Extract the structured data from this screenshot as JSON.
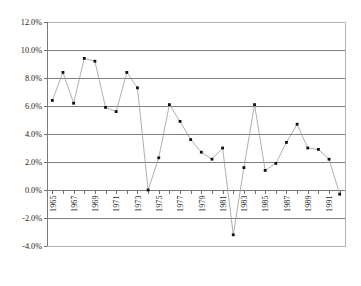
{
  "chart_data": {
    "type": "line",
    "title": "",
    "subtitle": "",
    "xlabel": "",
    "ylabel": "",
    "grid": true,
    "legend": null,
    "legend_position": "none",
    "marker": "square",
    "ylim": [
      -0.04,
      0.12
    ],
    "y_ticks": [
      0.12,
      0.1,
      0.08,
      0.06,
      0.04,
      0.02,
      0.0,
      -0.02,
      -0.04
    ],
    "y_tick_labels": [
      "12.0%",
      "10.0%",
      "8.0%",
      "6.0%",
      "4.0%",
      "2.0%",
      "0.0%",
      "-2.0%",
      "-4.0%"
    ],
    "x_tick_labels": [
      "1965",
      "1967",
      "1969",
      "1971",
      "1973",
      "1975",
      "1977",
      "1979",
      "1981",
      "1983",
      "1985",
      "1987",
      "1989",
      "1991"
    ],
    "x_label_interval": 2,
    "x": [
      1965,
      1966,
      1967,
      1968,
      1969,
      1970,
      1971,
      1972,
      1973,
      1974,
      1975,
      1976,
      1977,
      1978,
      1979,
      1980,
      1981,
      1982,
      1983,
      1984,
      1985,
      1986,
      1987,
      1988,
      1989,
      1990,
      1991,
      1992
    ],
    "categories": [
      "1965",
      "1966",
      "1967",
      "1968",
      "1969",
      "1970",
      "1971",
      "1972",
      "1973",
      "1974",
      "1975",
      "1976",
      "1977",
      "1978",
      "1979",
      "1980",
      "1981",
      "1982",
      "1983",
      "1984",
      "1985",
      "1986",
      "1987",
      "1988",
      "1989",
      "1990",
      "1991",
      "1992"
    ],
    "values": [
      6.4,
      8.4,
      6.2,
      9.4,
      9.2,
      5.9,
      5.6,
      8.4,
      7.3,
      0.0,
      2.3,
      6.1,
      4.9,
      3.6,
      2.7,
      2.2,
      3.0,
      -3.2,
      1.6,
      6.1,
      1.4,
      1.9,
      3.4,
      4.7,
      3.0,
      2.9,
      2.2,
      -0.3
    ],
    "value_unit": "%",
    "series": [
      {
        "name": "",
        "values": [
          6.4,
          8.4,
          6.2,
          9.4,
          9.2,
          5.9,
          5.6,
          8.4,
          7.3,
          0.0,
          2.3,
          6.1,
          4.9,
          3.6,
          2.7,
          2.2,
          3.0,
          -3.2,
          1.6,
          6.1,
          1.4,
          1.9,
          3.4,
          4.7,
          3.0,
          2.9,
          2.2,
          -0.3
        ],
        "color": "#9a9a9a",
        "marker_color": "#111111"
      }
    ],
    "colors": {
      "line": "#9a9a9a",
      "marker": "#111111",
      "gridline": "#808080",
      "axis": "#7a7a7a",
      "plot_border": "#b5b5b5",
      "background": "#ffffff",
      "text": "#1a1a1a"
    }
  }
}
